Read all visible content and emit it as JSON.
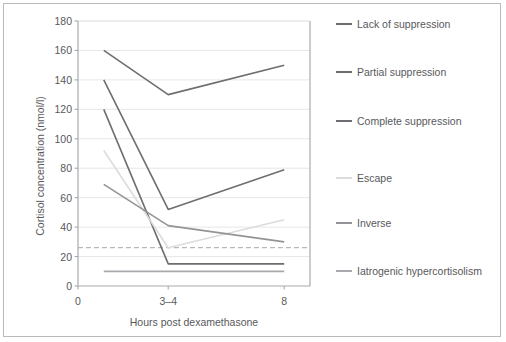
{
  "chart_data": {
    "type": "line",
    "title": "",
    "xlabel": "Hours post dexamethasone",
    "ylabel": "Cortisol concentration (nmol/l)",
    "x": [
      1,
      3.5,
      8
    ],
    "categories": [
      "0",
      "3–4",
      "8"
    ],
    "xtick_labels": [
      "0",
      "3–4",
      "8"
    ],
    "xtick_values": [
      0,
      3.5,
      8
    ],
    "xlim": [
      0,
      9
    ],
    "ylim": [
      0,
      180
    ],
    "ytick_labels": [
      "180",
      "160",
      "140",
      "120",
      "100",
      "80",
      "60",
      "40",
      "20",
      "0"
    ],
    "ytick_values": [
      180,
      160,
      140,
      120,
      100,
      80,
      60,
      40,
      20,
      0
    ],
    "grid": true,
    "grid_axis": "y",
    "legend_position": "right",
    "series": [
      {
        "name": "Lack of suppression",
        "values": [
          160,
          130,
          150
        ],
        "color": "#6d6e71",
        "width": 1.6,
        "dash": false
      },
      {
        "name": "Partial suppression",
        "values": [
          140,
          52,
          79
        ],
        "color": "#6d6e71",
        "width": 1.6,
        "dash": false
      },
      {
        "name": "Complete suppression",
        "values": [
          120,
          15,
          15
        ],
        "color": "#6d6e71",
        "width": 1.6,
        "dash": false
      },
      {
        "name": "Escape",
        "values": [
          92,
          26,
          45
        ],
        "color": "#dcdcdc",
        "width": 1.6,
        "dash": false
      },
      {
        "name": "Inverse",
        "values": [
          69,
          41,
          30
        ],
        "color": "#929497",
        "width": 1.6,
        "dash": false
      },
      {
        "name": "Iatrogenic hypercortisolism",
        "values": [
          10,
          10,
          10
        ],
        "color": "#a7a9ac",
        "width": 1.8,
        "dash": false
      }
    ],
    "reference_line": {
      "value": 26,
      "dash": true,
      "color": "#b5b7b9",
      "label": ""
    },
    "colors": {
      "grid": "#e6e7e8",
      "axis": "#a7a9ac",
      "frame": "#b9babc",
      "text": "#58595b",
      "background": "#ffffff"
    }
  },
  "legend": {
    "items": [
      {
        "label": "Lack of suppression"
      },
      {
        "label": "Partial suppression"
      },
      {
        "label": "Complete suppression"
      },
      {
        "label": "Escape"
      },
      {
        "label": "Inverse"
      },
      {
        "label": "Iatrogenic hypercortisolism"
      }
    ]
  }
}
